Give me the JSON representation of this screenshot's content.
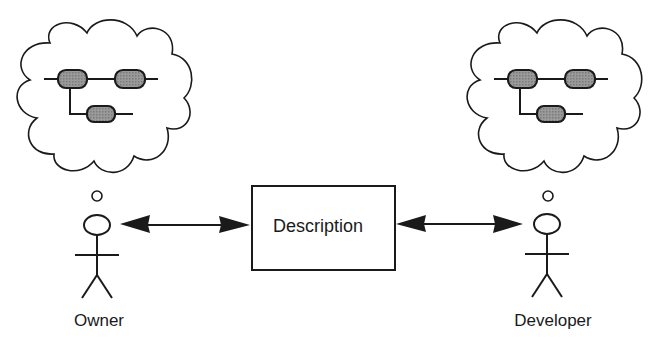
{
  "diagram": {
    "center_box": {
      "label": "Description"
    },
    "actors": [
      {
        "id": "owner",
        "label": "Owner"
      },
      {
        "id": "developer",
        "label": "Developer"
      }
    ],
    "connections": [
      {
        "from": "owner",
        "to": "description",
        "type": "bidirectional-arrow"
      },
      {
        "from": "description",
        "to": "developer",
        "type": "bidirectional-arrow"
      }
    ],
    "thought_clouds": [
      {
        "actor": "owner",
        "content": "process-model-icon",
        "nodes": 3
      },
      {
        "actor": "developer",
        "content": "process-model-icon",
        "nodes": 3
      }
    ],
    "colors": {
      "stroke": "#1a1a1a",
      "node_fill": "#8a8a8a",
      "background": "#ffffff"
    }
  }
}
